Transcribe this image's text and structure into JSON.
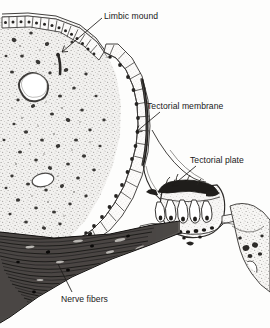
{
  "figure": {
    "background_color": "#fdfdfc",
    "ink_color": "#1a1a1a",
    "labels": [
      {
        "id": "limbic-mound",
        "text": "Limbic mound"
      },
      {
        "id": "tectorial-membrane",
        "text": "Tectorial membrane"
      },
      {
        "id": "tectorial-plate",
        "text": "Tectorial plate"
      },
      {
        "id": "nerve-fibers",
        "text": "Nerve fibers"
      }
    ],
    "structures": [
      {
        "id": "connective-tissue-stroma",
        "name": "Stippled connective tissue stroma with scattered nuclei"
      },
      {
        "id": "blood-vessel-lumen",
        "name": "Large blood vessel lumen"
      },
      {
        "id": "vacuole",
        "name": "Small clear vacuole"
      },
      {
        "id": "columnar-epithelium",
        "name": "Columnar epithelial cell layer lining the limbic mound"
      },
      {
        "id": "cuboidal-epithelium",
        "name": "Cuboidal epithelium along upper surface"
      },
      {
        "id": "tectorial-membrane-strand",
        "name": "Thin dark tectorial membrane strand"
      },
      {
        "id": "tectorial-plate-dome",
        "name": "Dome-shaped tectorial plate with sensory hair cells"
      },
      {
        "id": "hair-cells",
        "name": "Elongated pear-shaped sensory hair cells"
      },
      {
        "id": "nerve-fiber-bundle",
        "name": "Dense wavy nerve fiber bundle"
      },
      {
        "id": "tissue-fragment-right",
        "name": "Stippled tissue fragment at right margin"
      }
    ]
  }
}
